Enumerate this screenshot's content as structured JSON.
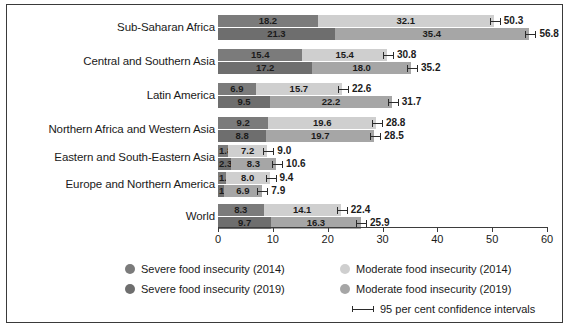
{
  "chart_data": {
    "type": "bar",
    "subtype": "grouped-stacked-horizontal",
    "title": "",
    "xlabel": "",
    "ylabel": "",
    "xlim": [
      0,
      60
    ],
    "xticks": [
      0,
      10,
      20,
      30,
      40,
      50,
      60
    ],
    "grid": false,
    "legend_position": "bottom",
    "categories": [
      "Sub-Saharan Africa",
      "Central and Southern Asia",
      "Latin America",
      "Northern Africa and Western Asia",
      "Eastern and South-Eastern Asia",
      "Europe and Northern America",
      "World"
    ],
    "series": [
      {
        "name": "Severe food insecurity (2014)",
        "year": "2014",
        "level": "severe",
        "color": "#7b7b7b",
        "values": [
          18.2,
          15.4,
          6.9,
          9.2,
          1.8,
          1.4,
          8.3
        ]
      },
      {
        "name": "Moderate food insecurity (2014)",
        "year": "2014",
        "level": "moderate",
        "color": "#cfcfcf",
        "values": [
          32.1,
          15.4,
          15.7,
          19.6,
          7.2,
          8.0,
          14.1
        ]
      },
      {
        "name": "Severe food insecurity (2019)",
        "year": "2019",
        "level": "severe",
        "color": "#6e6e6e",
        "values": [
          21.3,
          17.2,
          9.5,
          8.8,
          2.3,
          1.1,
          9.7
        ]
      },
      {
        "name": "Moderate food insecurity (2019)",
        "year": "2019",
        "level": "moderate",
        "color": "#a6a6a6",
        "values": [
          35.4,
          18.0,
          22.2,
          19.7,
          8.3,
          6.9,
          16.3
        ]
      }
    ],
    "totals": {
      "2014": [
        50.3,
        30.8,
        22.6,
        28.8,
        9.0,
        9.4,
        22.4
      ],
      "2019": [
        56.8,
        35.2,
        31.7,
        28.5,
        10.6,
        7.9,
        25.9
      ]
    },
    "rows": [
      {
        "category": "Sub-Saharan Africa",
        "bars": [
          {
            "year": "2014",
            "severe": 18.2,
            "moderate": 32.1,
            "total": 50.3,
            "total_label": "50.3",
            "severe_label": "18.2",
            "moderate_label": "32.1"
          },
          {
            "year": "2019",
            "severe": 21.3,
            "moderate": 35.4,
            "total": 56.8,
            "total_label": "56.8",
            "severe_label": "21.3",
            "moderate_label": "35.4"
          }
        ]
      },
      {
        "category": "Central and Southern Asia",
        "bars": [
          {
            "year": "2014",
            "severe": 15.4,
            "moderate": 15.4,
            "total": 30.8,
            "total_label": "30.8",
            "severe_label": "15.4",
            "moderate_label": "15.4"
          },
          {
            "year": "2019",
            "severe": 17.2,
            "moderate": 18.0,
            "total": 35.2,
            "total_label": "35.2",
            "severe_label": "17.2",
            "moderate_label": "18.0"
          }
        ]
      },
      {
        "category": "Latin America",
        "bars": [
          {
            "year": "2014",
            "severe": 6.9,
            "moderate": 15.7,
            "total": 22.6,
            "total_label": "22.6",
            "severe_label": "6.9",
            "moderate_label": "15.7"
          },
          {
            "year": "2019",
            "severe": 9.5,
            "moderate": 22.2,
            "total": 31.7,
            "total_label": "31.7",
            "severe_label": "9.5",
            "moderate_label": "22.2"
          }
        ]
      },
      {
        "category": "Northern Africa and Western Asia",
        "bars": [
          {
            "year": "2014",
            "severe": 9.2,
            "moderate": 19.6,
            "total": 28.8,
            "total_label": "28.8",
            "severe_label": "9.2",
            "moderate_label": "19.6"
          },
          {
            "year": "2019",
            "severe": 8.8,
            "moderate": 19.7,
            "total": 28.5,
            "total_label": "28.5",
            "severe_label": "8.8",
            "moderate_label": "19.7"
          }
        ]
      },
      {
        "category": "Eastern and South-Eastern Asia",
        "bars": [
          {
            "year": "2014",
            "severe": 1.8,
            "moderate": 7.2,
            "total": 9.0,
            "total_label": "9.0",
            "severe_label": "1.8",
            "moderate_label": "7.2"
          },
          {
            "year": "2019",
            "severe": 2.3,
            "moderate": 8.3,
            "total": 10.6,
            "total_label": "10.6",
            "severe_label": "2.3",
            "moderate_label": "8.3"
          }
        ]
      },
      {
        "category": "Europe and Northern America",
        "bars": [
          {
            "year": "2014",
            "severe": 1.4,
            "moderate": 8.0,
            "total": 9.4,
            "total_label": "9.4",
            "severe_label": "1.4",
            "moderate_label": "8.0"
          },
          {
            "year": "2019",
            "severe": 1.1,
            "moderate": 6.9,
            "total": 7.9,
            "total_label": "7.9",
            "severe_label": "1.1",
            "moderate_label": "6.9"
          }
        ]
      },
      {
        "category": "World",
        "bars": [
          {
            "year": "2014",
            "severe": 8.3,
            "moderate": 14.1,
            "total": 22.4,
            "total_label": "22.4",
            "severe_label": "8.3",
            "moderate_label": "14.1"
          },
          {
            "year": "2019",
            "severe": 9.7,
            "moderate": 16.3,
            "total": 25.9,
            "total_label": "25.9",
            "severe_label": "9.7",
            "moderate_label": "16.3"
          }
        ]
      }
    ]
  },
  "axis": {
    "tick_labels": [
      "0",
      "10",
      "20",
      "30",
      "40",
      "50",
      "60"
    ]
  },
  "legend": {
    "items": [
      {
        "label": "Severe food insecurity (2014)",
        "marker": "dot",
        "color": "#7b7b7b"
      },
      {
        "label": "Moderate food insecurity (2014)",
        "marker": "dot",
        "color": "#cfcfcf"
      },
      {
        "label": "Severe food insecurity (2019)",
        "marker": "dot",
        "color": "#6e6e6e"
      },
      {
        "label": "Moderate food insecurity (2019)",
        "marker": "dot",
        "color": "#a6a6a6"
      },
      {
        "label": "95 per cent confidence intervals",
        "marker": "errorbar",
        "color": "#2b2b2b"
      }
    ]
  }
}
